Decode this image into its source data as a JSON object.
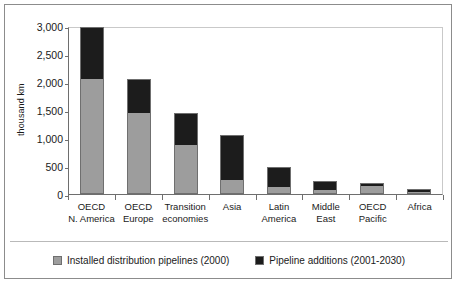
{
  "chart_data": {
    "type": "bar",
    "subtype": "stacked-vertical",
    "title": "",
    "xlabel": "",
    "ylabel": "thousand km",
    "ylim": [
      0,
      3000
    ],
    "yticks": [
      0,
      500,
      1000,
      1500,
      2000,
      2500,
      3000
    ],
    "ytick_labels": [
      "0",
      "500",
      "1,000",
      "1,500",
      "2,000",
      "2,500",
      "3,000"
    ],
    "grid": false,
    "legend_position": "bottom",
    "categories": [
      "OECD N. America",
      "OECD Europe",
      "Transition economies",
      "Asia",
      "Latin America",
      "Middle East",
      "OECD Pacific",
      "Africa"
    ],
    "category_lines": [
      [
        "OECD",
        "N. America"
      ],
      [
        "OECD",
        "Europe"
      ],
      [
        "Transition",
        "economies"
      ],
      [
        "Asia",
        ""
      ],
      [
        "Latin",
        "America"
      ],
      [
        "Middle",
        "East"
      ],
      [
        "OECD",
        "Pacific"
      ],
      [
        "Africa",
        ""
      ]
    ],
    "series": [
      {
        "name": "Installed distribution pipelines (2000)",
        "color": "#9d9d9d",
        "values": [
          2050,
          1450,
          870,
          250,
          120,
          80,
          140,
          30
        ]
      },
      {
        "name": "Pipeline additions (2001-2030)",
        "color": "#1c1c1c",
        "values": [
          940,
          600,
          570,
          800,
          360,
          160,
          60,
          60
        ]
      }
    ],
    "totals": [
      2990,
      2050,
      1440,
      1050,
      480,
      240,
      200,
      90
    ]
  },
  "legend": {
    "items": [
      {
        "label": "Installed distribution pipelines (2000)",
        "color": "#9d9d9d",
        "swatch": "gray-swatch"
      },
      {
        "label": "Pipeline additions (2001-2030)",
        "color": "#1c1c1c",
        "swatch": "black-swatch"
      }
    ]
  },
  "axis": {
    "y_title": "thousand km"
  }
}
